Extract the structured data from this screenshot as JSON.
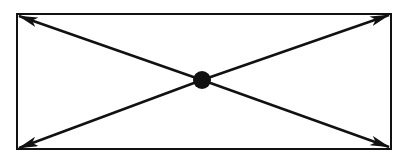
{
  "diagram": {
    "colors": {
      "stroke": "#111111",
      "background": "#ffffff"
    },
    "rectangle": {
      "x": 17,
      "y": 14,
      "width": 374,
      "height": 135
    },
    "center": {
      "x": 202,
      "y": 80,
      "r": 9
    },
    "arrows": [
      {
        "name": "arrow-top-left",
        "to": [
          19,
          16
        ]
      },
      {
        "name": "arrow-top-right",
        "to": [
          389,
          15
        ]
      },
      {
        "name": "arrow-bottom-left",
        "to": [
          19,
          148
        ]
      },
      {
        "name": "arrow-bottom-right",
        "to": [
          389,
          147
        ]
      }
    ]
  }
}
